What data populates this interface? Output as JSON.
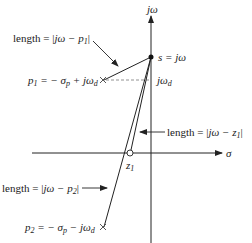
{
  "diagram": {
    "axes": {
      "vertical_label": "jω",
      "horizontal_label": "σ"
    },
    "point_s": {
      "label": "s = jω"
    },
    "level_label": "jω",
    "level_label_sub": "d",
    "pole1": {
      "label_main": "p",
      "label_sub": "1",
      "label_rest": " = − σ",
      "label_rest_sub": "p",
      "label_tail": " + jω",
      "label_tail_sub": "d"
    },
    "pole2": {
      "label_main": "p",
      "label_sub": "2",
      "label_rest": " = − σ",
      "label_rest_sub": "p",
      "label_tail": " − jω",
      "label_tail_sub": "d"
    },
    "zero1": {
      "label_main": "z",
      "label_sub": "1"
    },
    "length_p1": {
      "prefix": "length = |",
      "expr": "jω − p",
      "sub": "1",
      "suffix": "|"
    },
    "length_z1": {
      "prefix": "length = |",
      "expr": "jω − z",
      "sub": "1",
      "suffix": "|"
    },
    "length_p2": {
      "prefix": "length = |",
      "expr": "jω − p",
      "sub": "2",
      "suffix": "|"
    },
    "colors": {
      "stroke": "#222222",
      "dashed": "#777777",
      "background": "#ffffff"
    }
  }
}
